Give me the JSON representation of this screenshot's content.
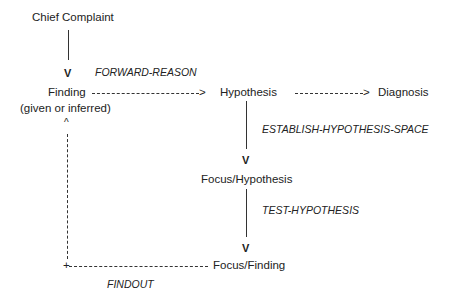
{
  "nodes": {
    "chief_complaint": "Chief Complaint",
    "finding": "Finding",
    "finding_sub": "(given or inferred)",
    "hypothesis": "Hypothesis",
    "diagnosis": "Diagnosis",
    "focus_hypothesis": "Focus/Hypothesis",
    "focus_finding": "Focus/Finding"
  },
  "edges": {
    "forward_reason": "FORWARD-REASON",
    "establish_hypothesis_space": "ESTABLISH-HYPOTHESIS-SPACE",
    "test_hypothesis": "TEST-HYPOTHESIS",
    "findout": "FINDOUT"
  },
  "glyphs": {
    "arrow_down": "V",
    "arrow_right": ">",
    "arrow_up": "^",
    "corner": "+"
  }
}
